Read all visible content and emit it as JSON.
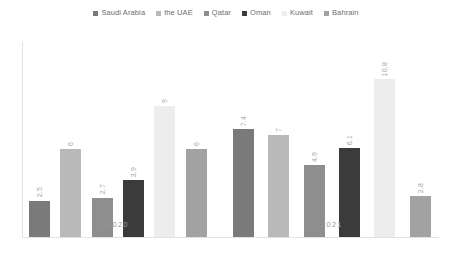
{
  "chart_data": {
    "type": "bar",
    "title": "",
    "subtitle": "",
    "xlabel": "",
    "ylabel": "",
    "categories": [
      "2020",
      "2021"
    ],
    "series": [
      {
        "name": "Saudi Arabia",
        "color": "#7a7a7a",
        "values": [
          2.5,
          7.4
        ]
      },
      {
        "name": "the UAE",
        "color": "#b9b9b9",
        "values": [
          6,
          7
        ]
      },
      {
        "name": "Qatar",
        "color": "#8e8e8e",
        "values": [
          2.7,
          4.9
        ]
      },
      {
        "name": "Oman",
        "color": "#3b3b3b",
        "values": [
          3.9,
          6.1
        ]
      },
      {
        "name": "Kuwait",
        "color": "#ededed",
        "values": [
          9,
          10.8
        ]
      },
      {
        "name": "Bahrain",
        "color": "#a2a2a2",
        "values": [
          6,
          2.8
        ]
      }
    ],
    "data_labels": {
      "2020": [
        "2.5",
        "6",
        "2.7",
        "3.9",
        "9",
        "6"
      ],
      "2021": [
        "7.4",
        "7",
        "4.9",
        "6.1",
        "10.8",
        "2.8"
      ]
    },
    "ylim": [
      0,
      12.4
    ],
    "grid": false,
    "legend_position": "top"
  },
  "legend": {
    "items": [
      {
        "label": "Saudi Arabia",
        "color": "#7a7a7a"
      },
      {
        "label": "the UAE",
        "color": "#b9b9b9"
      },
      {
        "label": "Qatar",
        "color": "#8e8e8e"
      },
      {
        "label": "Oman",
        "color": "#3b3b3b"
      },
      {
        "label": "Kuwait",
        "color": "#ededed"
      },
      {
        "label": "Bahrain",
        "color": "#a2a2a2"
      }
    ]
  },
  "axis": {
    "group_labels": [
      "2020",
      "2021"
    ]
  }
}
